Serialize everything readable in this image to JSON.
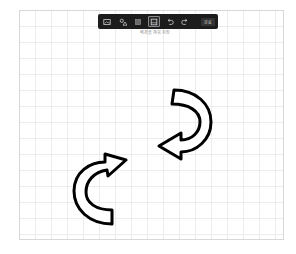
{
  "toolbar": {
    "tools": [
      {
        "name": "image-tool",
        "icon": "image-icon",
        "selected": false
      },
      {
        "name": "shapes-tool",
        "icon": "shapes-icon",
        "selected": false
      },
      {
        "name": "fill-tool",
        "icon": "square-icon",
        "selected": false
      },
      {
        "name": "select-tool",
        "icon": "frame-icon",
        "selected": true
      },
      {
        "name": "undo",
        "icon": "undo-icon",
        "selected": false
      },
      {
        "name": "redo",
        "icon": "redo-icon",
        "selected": false
      }
    ],
    "done_label": "완료"
  },
  "caption": "배경을 채워 저장",
  "canvas": {
    "grid_color": "#ececec",
    "background": "#ffffff",
    "shapes": [
      {
        "type": "curved-arrow",
        "direction": "clockwise-down-left",
        "stroke": "#000000",
        "fill": "#ffffff"
      },
      {
        "type": "curved-arrow",
        "direction": "clockwise-up-right",
        "stroke": "#000000",
        "fill": "#ffffff"
      }
    ]
  },
  "colors": {
    "toolbar_bg": "#1c1c1c",
    "icon": "#cfcfcf",
    "stroke": "#000000"
  }
}
